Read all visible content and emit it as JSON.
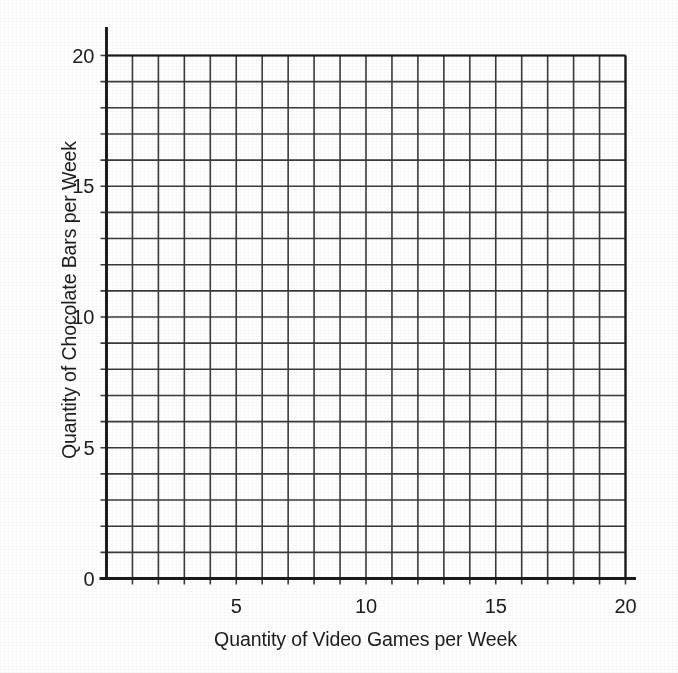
{
  "chart_data": {
    "type": "scatter",
    "title": "",
    "subtitle": "",
    "xlabel": "Quantity of Video Games per Week",
    "ylabel": "Quantity of Chocolate Bars per Week",
    "xlim": [
      0,
      20
    ],
    "ylim": [
      0,
      20
    ],
    "xticks": [
      0,
      5,
      10,
      15,
      20
    ],
    "yticks": [
      0,
      5,
      10,
      15,
      20
    ],
    "xtick_labels": [
      "0",
      "5",
      "10",
      "15",
      "20"
    ],
    "ytick_labels": [
      "0",
      "5",
      "10",
      "15",
      "20"
    ],
    "minor_tick_step": 1,
    "grid": true,
    "grid_columns": 20,
    "grid_rows": 20,
    "legend": null,
    "legend_position": "none",
    "series": [],
    "values": [],
    "annotations": [],
    "note": "Empty plotting grid: blank 20-by-20 graph paper axes with no data plotted."
  },
  "axes": {
    "x": {
      "label": "Quantity of Video Games per Week",
      "ticks": [
        {
          "value": 0,
          "label": "0",
          "show_label": false
        },
        {
          "value": 5,
          "label": "5",
          "show_label": true
        },
        {
          "value": 10,
          "label": "10",
          "show_label": true
        },
        {
          "value": 15,
          "label": "15",
          "show_label": true
        },
        {
          "value": 20,
          "label": "20",
          "show_label": true
        }
      ]
    },
    "y": {
      "label": "Quantity of Chocolate Bars per Week",
      "ticks": [
        {
          "value": 0,
          "label": "0",
          "show_label": true
        },
        {
          "value": 5,
          "label": "5",
          "show_label": true
        },
        {
          "value": 10,
          "label": "10",
          "show_label": true
        },
        {
          "value": 15,
          "label": "15",
          "show_label": true
        },
        {
          "value": 20,
          "label": "20",
          "show_label": true
        }
      ]
    }
  },
  "style": {
    "background": "#ffffff",
    "grid_color": "#3b3b3b",
    "axis_color": "#1a1a1a",
    "text_color": "#1c1c1c"
  }
}
